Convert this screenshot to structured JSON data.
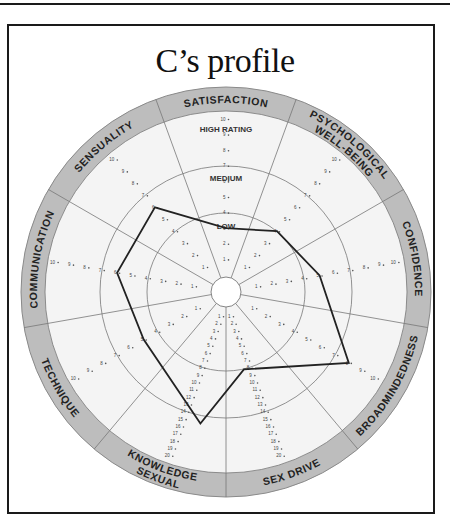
{
  "title": "C’s profile",
  "zones": {
    "high": "HIGH RATING",
    "medium": "MEDIUM",
    "low": "LOW"
  },
  "colors": {
    "band": "#bdbdbd",
    "band_stroke": "#8a8a8a",
    "disc": "#f4f4f4",
    "grid": "#777777",
    "profile": "#222222",
    "frame": "#1a1a1a"
  },
  "chart_data": {
    "type": "radar",
    "title": "C’s profile",
    "axes": [
      {
        "name": "SATISFACTION",
        "max": 10,
        "value": 3
      },
      {
        "name": "PSYCHOLOGICAL WELL-BEING",
        "max": 10,
        "value": 4
      },
      {
        "name": "CONFIDENCE",
        "max": 10,
        "value": 5
      },
      {
        "name": "BROADMINDEDNESS",
        "max": 10,
        "value": 8
      },
      {
        "name": "SEX DRIVE",
        "max": 20,
        "value": 8
      },
      {
        "name": "SEXUAL KNOWLEDGE",
        "max": 20,
        "value": 15
      },
      {
        "name": "TECHNIQUE",
        "max": 10,
        "value": 5
      },
      {
        "name": "COMMUNICATION",
        "max": 10,
        "value": 6
      },
      {
        "name": "SENSUALITY",
        "max": 10,
        "value": 6
      }
    ],
    "rating_zones": [
      {
        "label": "LOW",
        "range": [
          1,
          4
        ]
      },
      {
        "label": "MEDIUM",
        "range": [
          5,
          7
        ]
      },
      {
        "label": "HIGH RATING",
        "range": [
          8,
          10
        ]
      }
    ],
    "tick_labels_1_to_10": [
      "1",
      "2",
      "3",
      "4",
      "5",
      "6",
      "7",
      "8",
      "9",
      "10"
    ],
    "tick_labels_1_to_20": [
      "1",
      "2",
      "3",
      "4",
      "5",
      "6",
      "7",
      "8",
      "9",
      "10",
      "11",
      "12",
      "13",
      "14",
      "15",
      "16",
      "17",
      "18",
      "19",
      "20"
    ],
    "grid": true,
    "legend": "none"
  }
}
